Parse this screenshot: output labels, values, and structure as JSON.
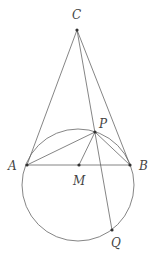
{
  "diagram": {
    "type": "geometry",
    "stroke_color": "#666666",
    "point_color": "#333333",
    "circle": {
      "cx": 78,
      "cy": 185,
      "r": 56
    },
    "points": [
      {
        "name": "C",
        "x": 77,
        "y": 30,
        "label_x": 72,
        "label_y": 19
      },
      {
        "name": "A",
        "x": 27,
        "y": 165,
        "label_x": 8,
        "label_y": 170
      },
      {
        "name": "B",
        "x": 130,
        "y": 165,
        "label_x": 139,
        "label_y": 170
      },
      {
        "name": "M",
        "x": 79,
        "y": 165,
        "label_x": 73,
        "label_y": 185
      },
      {
        "name": "P",
        "x": 95,
        "y": 132,
        "label_x": 99,
        "label_y": 128
      },
      {
        "name": "Q",
        "x": 112,
        "y": 230,
        "label_x": 111,
        "label_y": 247
      }
    ],
    "segments": [
      [
        "C",
        "A"
      ],
      [
        "C",
        "B"
      ],
      [
        "C",
        "Q"
      ],
      [
        "A",
        "B"
      ],
      [
        "P",
        "A"
      ],
      [
        "P",
        "B"
      ],
      [
        "P",
        "M"
      ]
    ]
  }
}
